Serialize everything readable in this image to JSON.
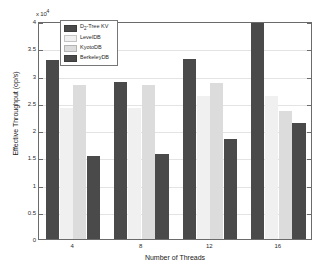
{
  "chart_data": {
    "type": "bar",
    "title": "",
    "xlabel": "Number of Threads",
    "ylabel": "Effective Throughput (op/s)",
    "y_exponent_label": "x 10",
    "y_exponent_power": "4",
    "categories": [
      "4",
      "8",
      "12",
      "16"
    ],
    "ylim": [
      0,
      4
    ],
    "yticks": [
      "0",
      "0.5",
      "1",
      "1.5",
      "2",
      "2.5",
      "3",
      "3.5",
      "4"
    ],
    "ytick_values": [
      0,
      0.5,
      1,
      1.5,
      2,
      2.5,
      3,
      3.5,
      4
    ],
    "grid": true,
    "legend_position": "top-left inside",
    "series": [
      {
        "name": "D2-Tree KV",
        "name_base": "D",
        "name_sub": "2",
        "name_rest": "-Tree KV",
        "color": "#4a4a4a",
        "values": [
          3.28,
          2.88,
          3.3,
          4.0
        ]
      },
      {
        "name": "LevelDB",
        "color": "#f0f0f0",
        "values": [
          2.4,
          2.4,
          2.62,
          2.62
        ]
      },
      {
        "name": "KyotoDB",
        "color": "#dcdcdc",
        "values": [
          2.83,
          2.83,
          2.87,
          2.35
        ]
      },
      {
        "name": "BerkeleyDB",
        "color": "#4a4a4a",
        "values": [
          1.52,
          1.56,
          1.84,
          2.12
        ]
      }
    ]
  },
  "figure": {
    "background_color": "#ffffff",
    "axis_color": "#6b6b6b",
    "grid_color": "#e3e3e3"
  }
}
